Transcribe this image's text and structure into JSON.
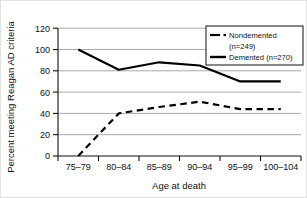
{
  "chart_data": {
    "type": "line",
    "title": "",
    "xlabel": "Age at death",
    "ylabel": "Percent meeting Reagan AD criteria",
    "categories": [
      "75–79",
      "80–84",
      "85–89",
      "90–94",
      "95–99",
      "100–104"
    ],
    "ylim": [
      0,
      120
    ],
    "yticks": [
      0,
      20,
      40,
      60,
      80,
      100,
      120
    ],
    "ytick_labels": [
      "0",
      "20",
      "40",
      "60",
      "80",
      "100",
      "120"
    ],
    "grid": "horizontal",
    "legend_position": "top-right",
    "series": [
      {
        "name": "Nondemented",
        "legend_label": "Nondemented (n=249)",
        "legend_label_line1": "Nondemented",
        "legend_label_line2": "(n=249)",
        "n": 249,
        "style": "dashed",
        "color": "#000000",
        "values": [
          0,
          40,
          46,
          51,
          44,
          44
        ]
      },
      {
        "name": "Demented",
        "legend_label": "Demented (n=270)",
        "n": 270,
        "style": "solid",
        "color": "#000000",
        "values": [
          100,
          81,
          88,
          85,
          70,
          70
        ]
      }
    ]
  },
  "axes": {
    "x_label": "Age at death",
    "y_label": "Percent meeting Reagan AD criteria",
    "x_tick_labels": [
      "75–79",
      "80–84",
      "85–89",
      "90–94",
      "95–99",
      "100–104"
    ],
    "y_tick_labels": [
      "120",
      "100",
      "80",
      "60",
      "40",
      "20",
      "0"
    ]
  },
  "legend": {
    "entries": [
      {
        "label_line1": "Nondemented",
        "label_line2": "(n=249)",
        "marker": "dash-dot-line"
      },
      {
        "label_line1": "Demented (n=270)",
        "label_line2": "",
        "marker": "solid-line"
      }
    ]
  },
  "colors": {
    "series": "#000000",
    "grid": "#a8a8a8",
    "axis": "#111111",
    "background": "#ffffff",
    "border": "#e2e2e2"
  }
}
